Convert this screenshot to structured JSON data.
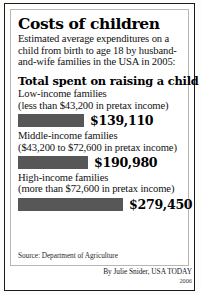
{
  "graphic": {
    "title": "Costs of children",
    "intro": "Estimated average expenditures on a child from birth to age 18 by husband-and-wife families in the USA in 2005:",
    "section_heading": "Total spent on raising a child",
    "source": "Source: Department of Agriculture",
    "credit": "By Julie Snider, USA TODAY",
    "year": "2006",
    "bar_color": "#575757",
    "frame_color": "#1a1a1a",
    "inner_border_color": "#b9b7b2"
  },
  "chart_data": {
    "type": "bar",
    "title": "Costs of children",
    "subtitle": "Total spent on raising a child",
    "orientation": "horizontal",
    "xlabel": "",
    "ylabel": "",
    "grid": false,
    "legend": "none",
    "categories": [
      "Low-income families",
      "Middle-income families",
      "High-income families"
    ],
    "category_detail": [
      "(less than $43,200 in pretax income)",
      "($43,200 to $72,600 in pretax income)",
      "(more than $72,600 in pretax income)"
    ],
    "values": [
      139110,
      190980,
      279450
    ],
    "value_labels": [
      "$139,110",
      "$190,980",
      "$279,450"
    ],
    "bar_widths_px": [
      66,
      70,
      105
    ],
    "xlim": [
      0,
      279450
    ],
    "units": "US dollars",
    "annotations": [
      "Estimated average expenditures on a child from birth to age 18 by husband-and-wife families in the USA in 2005:"
    ]
  }
}
